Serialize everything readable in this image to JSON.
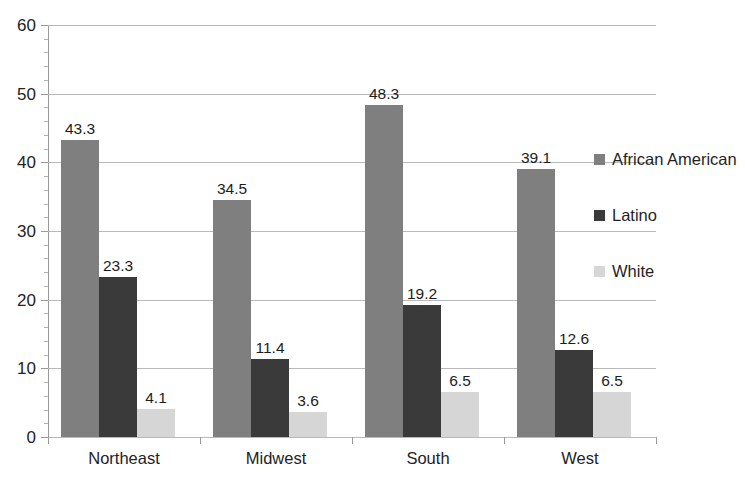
{
  "chart_data": {
    "type": "bar",
    "title": "",
    "subtitle": "",
    "xlabel": "",
    "ylabel": "",
    "ylim": [
      0,
      60
    ],
    "ytick_labels": [
      "0",
      "10",
      "20",
      "30",
      "40",
      "50",
      "60"
    ],
    "ytick_values": [
      0,
      10,
      20,
      30,
      40,
      50,
      60
    ],
    "ytick_step": 10,
    "minor_tick_step": 2,
    "grid": "horizontal",
    "legend_position": "right",
    "categories": [
      "Northeast",
      "Midwest",
      "South",
      "West"
    ],
    "series": [
      {
        "name": "African American",
        "color": "#7f7f7f",
        "values": [
          43.3,
          34.5,
          48.3,
          39.1
        ],
        "labels": [
          "43.3",
          "34.5",
          "48.3",
          "39.1"
        ]
      },
      {
        "name": "Latino",
        "color": "#3a3a3a",
        "values": [
          23.3,
          11.4,
          19.2,
          12.6
        ],
        "labels": [
          "23.3",
          "11.4",
          "19.2",
          "12.6"
        ]
      },
      {
        "name": "White",
        "color": "#d6d6d6",
        "values": [
          4.1,
          3.6,
          6.5,
          6.5
        ],
        "labels": [
          "4.1",
          "3.6",
          "6.5",
          "6.5"
        ]
      }
    ]
  },
  "legend": {
    "items": [
      {
        "label": "African American",
        "color": "#7f7f7f"
      },
      {
        "label": "Latino",
        "color": "#3a3a3a"
      },
      {
        "label": "White",
        "color": "#d6d6d6"
      }
    ]
  },
  "axis": {
    "y_labels": [
      "60",
      "50",
      "40",
      "30",
      "20",
      "10",
      "0"
    ],
    "x_labels": [
      "Northeast",
      "Midwest",
      "South",
      "West"
    ]
  },
  "colors": {
    "background": "#ffffff",
    "gridline": "#b9b9b9",
    "axis": "#9a9a9a",
    "text": "#1c1c1c"
  }
}
